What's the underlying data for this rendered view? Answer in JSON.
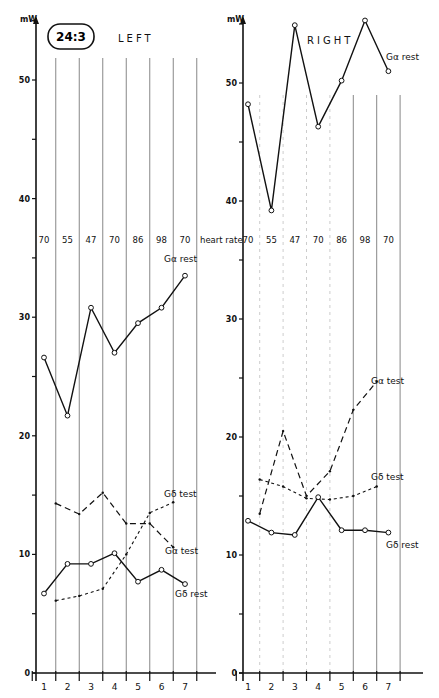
{
  "header": {
    "badge": "24:3",
    "left_title": "LEFT",
    "right_title": "RIGHT",
    "unit": "mW"
  },
  "heart_rate_label": "heart rate",
  "chart_data": [
    {
      "type": "line",
      "title": "LEFT",
      "xlabel": "",
      "ylabel": "mW",
      "ylim": [
        0,
        55
      ],
      "yticks": [
        0,
        10,
        20,
        30,
        40,
        50
      ],
      "categories": [
        "1",
        "2",
        "3",
        "4",
        "5",
        "6",
        "7"
      ],
      "heart_rate": [
        70,
        55,
        47,
        70,
        86,
        98,
        70
      ],
      "series": [
        {
          "name": "Gα rest",
          "style": "solid-circles",
          "x": [
            1,
            2,
            3,
            4,
            5,
            6,
            7
          ],
          "values": [
            26.6,
            21.7,
            30.8,
            27.0,
            29.5,
            30.8,
            33.5
          ]
        },
        {
          "name": "Gα test",
          "style": "dashed",
          "x": [
            1.5,
            2.5,
            3.5,
            4.5,
            5.5,
            6.5
          ],
          "values": [
            14.3,
            13.4,
            15.2,
            12.6,
            12.6,
            10.6
          ]
        },
        {
          "name": "Gδ test",
          "style": "dotted",
          "x": [
            1.5,
            2.5,
            3.5,
            4.5,
            5.5,
            6.5
          ],
          "values": [
            6.1,
            6.5,
            7.1,
            10.0,
            13.5,
            14.4
          ]
        },
        {
          "name": "Gδ rest",
          "style": "solid-circles",
          "x": [
            1,
            2,
            3,
            4,
            5,
            6,
            7
          ],
          "values": [
            6.7,
            9.2,
            9.2,
            10.1,
            7.7,
            8.7,
            7.5
          ]
        }
      ]
    },
    {
      "type": "line",
      "title": "RIGHT",
      "xlabel": "",
      "ylabel": "mW",
      "ylim": [
        0,
        55
      ],
      "yticks": [
        0,
        10,
        20,
        30,
        40,
        50
      ],
      "categories": [
        "1",
        "2",
        "3",
        "4",
        "5",
        "6",
        "7"
      ],
      "heart_rate": [
        70,
        55,
        47,
        70,
        86,
        98,
        70
      ],
      "series": [
        {
          "name": "Gα rest",
          "style": "solid-circles",
          "x": [
            1,
            2,
            3,
            4,
            5,
            6,
            7
          ],
          "values": [
            48.2,
            39.2,
            54.9,
            46.3,
            50.2,
            55.3,
            51.0
          ]
        },
        {
          "name": "Gα test",
          "style": "dashed",
          "x": [
            1.5,
            2.5,
            3.5,
            4.5,
            5.5,
            6.5
          ],
          "values": [
            13.5,
            20.5,
            15.0,
            17.1,
            22.3,
            24.7
          ]
        },
        {
          "name": "Gδ test",
          "style": "dotted",
          "x": [
            1.5,
            2.5,
            3.5,
            4.5,
            5.5,
            6.5
          ],
          "values": [
            16.4,
            15.8,
            14.8,
            14.7,
            15.0,
            15.8
          ]
        },
        {
          "name": "Gδ rest",
          "style": "solid-circles",
          "x": [
            1,
            2,
            3,
            4,
            5,
            6,
            7
          ],
          "values": [
            12.9,
            11.9,
            11.7,
            14.9,
            12.1,
            12.1,
            11.9
          ]
        }
      ]
    }
  ],
  "labels": {
    "left": {
      "ga_rest": "Gα rest",
      "ga_test": "Gα test",
      "gd_test": "Gδ test",
      "gd_rest": "Gδ rest"
    },
    "right": {
      "ga_rest": "Gα rest",
      "ga_test": "Gα test",
      "gd_test": "Gδ test",
      "gd_rest": "Gδ rest"
    }
  },
  "ytick_labels": [
    "0",
    "10",
    "20",
    "30",
    "40",
    "50"
  ],
  "x_labels": [
    "1",
    "2",
    "3",
    "4",
    "5",
    "6",
    "7"
  ],
  "hr_values": [
    "70",
    "55",
    "47",
    "70",
    "86",
    "98",
    "70"
  ]
}
